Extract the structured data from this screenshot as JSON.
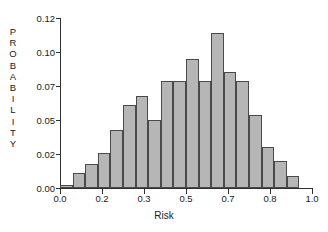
{
  "chart_data": {
    "type": "bar",
    "title": "",
    "subtitle": "",
    "xlabel": "Risk",
    "ylabel": "PROBABILITY",
    "ylabel_letters": [
      "P",
      "R",
      "O",
      "B",
      "A",
      "B",
      "I",
      "L",
      "I",
      "T",
      "Y"
    ],
    "xlim": [
      0.0,
      1.0
    ],
    "ylim": [
      0.0,
      0.125
    ],
    "grid": false,
    "legend": null,
    "bar_color": "#b6b6b6",
    "bar_edge_color": "#4a4a4a",
    "axis_color": "#303030",
    "xtick_labels": [
      "0.0",
      "0.2",
      "0.3",
      "0.5",
      "0.7",
      "0.8",
      "1.0"
    ],
    "xtick_values": [
      0.0,
      0.16667,
      0.33333,
      0.5,
      0.66667,
      0.83333,
      1.0
    ],
    "ytick_labels": [
      "0.00",
      "0.02",
      "0.05",
      "0.07",
      "0.10",
      "0.12"
    ],
    "ytick_values": [
      0.0,
      0.025,
      0.05,
      0.075,
      0.1,
      0.125
    ],
    "bin_width": 0.05,
    "bin_edges": [
      0.0,
      0.05,
      0.1,
      0.15,
      0.2,
      0.25,
      0.3,
      0.35,
      0.4,
      0.45,
      0.5,
      0.55,
      0.6,
      0.65,
      0.7,
      0.75,
      0.8,
      0.85,
      0.9,
      0.95,
      1.0
    ],
    "categories": [
      "0.00-0.05",
      "0.05-0.10",
      "0.10-0.15",
      "0.15-0.20",
      "0.20-0.25",
      "0.25-0.30",
      "0.30-0.35",
      "0.35-0.40",
      "0.40-0.45",
      "0.45-0.50",
      "0.50-0.55",
      "0.55-0.60",
      "0.60-0.65",
      "0.65-0.70",
      "0.70-0.75",
      "0.75-0.80",
      "0.80-0.85",
      "0.85-0.90",
      "0.90-0.95",
      "0.95-1.00"
    ],
    "values": [
      0.002,
      0.011,
      0.018,
      0.026,
      0.043,
      0.061,
      0.068,
      0.05,
      0.079,
      0.079,
      0.095,
      0.079,
      0.114,
      0.085,
      0.079,
      0.054,
      0.03,
      0.02,
      0.009,
      0.0
    ]
  }
}
